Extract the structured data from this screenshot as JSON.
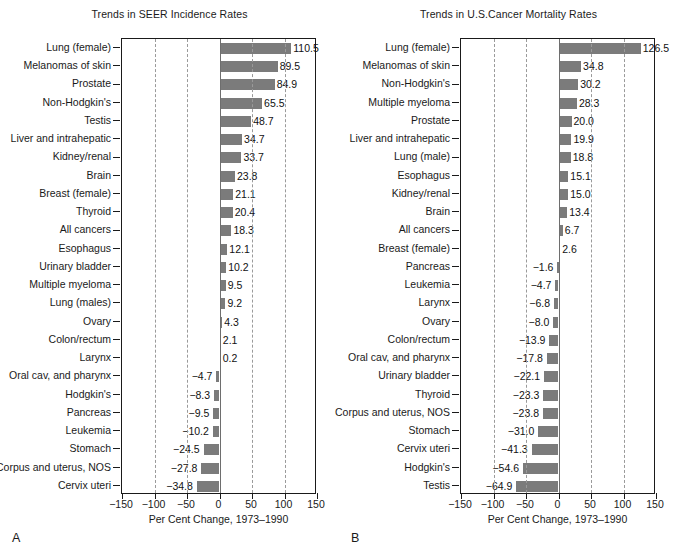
{
  "figure": {
    "axis_title": "Per Cent Change, 1973–1990",
    "bar_color": "#7b7b7b",
    "grid_color": "#9a9a9a",
    "axis_color": "#1a1a1a"
  },
  "panels": [
    {
      "letter": "A",
      "title": "Trends in SEER Incidence Rates",
      "axis_title": "Per Cent Change, 1973–1990"
    },
    {
      "letter": "B",
      "title": "Trends in U.S.Cancer Mortality Rates",
      "axis_title": "Per Cent Change, 1973–1990"
    }
  ],
  "chart_data": [
    {
      "type": "bar",
      "orientation": "horizontal",
      "panel": "A",
      "title": "Trends in SEER Incidence Rates",
      "xlabel": "Per Cent Change, 1973–1990",
      "ylabel": "",
      "xlim": [
        -150,
        150
      ],
      "xticks": [
        -150,
        -100,
        -50,
        0,
        50,
        100,
        150
      ],
      "xtick_labels": [
        "−150",
        "−100",
        "−50",
        "0",
        "50",
        "100",
        "150"
      ],
      "grid": "vertical-dashed",
      "legend": "none",
      "categories": [
        "Lung (female)",
        "Melanomas of skin",
        "Prostate",
        "Non-Hodgkin's",
        "Testis",
        "Liver and intrahepatic",
        "Kidney/renal",
        "Brain",
        "Breast (female)",
        "Thyroid",
        "All cancers",
        "Esophagus",
        "Urinary bladder",
        "Multiple myeloma",
        "Lung (males)",
        "Ovary",
        "Colon/rectum",
        "Larynx",
        "Oral cav, and pharynx",
        "Hodgkin's",
        "Pancreas",
        "Leukemia",
        "Stomach",
        "Corpus and uterus, NOS",
        "Cervix uteri"
      ],
      "values": [
        110.5,
        89.5,
        84.9,
        65.5,
        48.7,
        34.7,
        33.7,
        23.8,
        21.1,
        20.4,
        18.3,
        12.1,
        10.2,
        9.5,
        9.2,
        4.3,
        2.1,
        0.2,
        -4.7,
        -8.3,
        -9.5,
        -10.2,
        -24.5,
        -27.8,
        -34.8
      ],
      "value_labels": [
        "110.5",
        "89.5",
        "84.9",
        "65.5",
        "48.7",
        "34.7",
        "33.7",
        "23.8",
        "21.1",
        "20.4",
        "18.3",
        "12.1",
        "10.2",
        "9.5",
        "9.2",
        "4.3",
        "2.1",
        "0.2",
        "−4.7",
        "−8.3",
        "−9.5",
        "−10.2",
        "−24.5",
        "−27.8",
        "−34.8"
      ]
    },
    {
      "type": "bar",
      "orientation": "horizontal",
      "panel": "B",
      "title": "Trends in U.S.Cancer Mortality Rates",
      "xlabel": "Per Cent Change, 1973–1990",
      "ylabel": "",
      "xlim": [
        -150,
        150
      ],
      "xticks": [
        -150,
        -100,
        -50,
        0,
        50,
        100,
        150
      ],
      "xtick_labels": [
        "−150",
        "−100",
        "−50",
        "0",
        "50",
        "100",
        "150"
      ],
      "grid": "vertical-dashed",
      "legend": "none",
      "categories": [
        "Lung (female)",
        "Melanomas of skin",
        "Non-Hodgkin's",
        "Multiple myeloma",
        "Prostate",
        "Liver and intrahepatic",
        "Lung (male)",
        "Esophagus",
        "Kidney/renal",
        "Brain",
        "All cancers",
        "Breast (female)",
        "Pancreas",
        "Leukemia",
        "Larynx",
        "Ovary",
        "Colon/rectum",
        "Oral cav, and pharynx",
        "Urinary bladder",
        "Thyroid",
        "Corpus and uterus, NOS",
        "Stomach",
        "Cervix uteri",
        "Hodgkin's",
        "Testis"
      ],
      "values": [
        126.5,
        34.8,
        30.2,
        28.3,
        20.0,
        19.9,
        18.8,
        15.1,
        15.0,
        13.4,
        6.7,
        2.6,
        -1.6,
        -4.7,
        -6.8,
        -8.0,
        -13.9,
        -17.8,
        -22.1,
        -23.3,
        -23.8,
        -31.0,
        -41.3,
        -54.6,
        -64.9
      ],
      "value_labels": [
        "126.5",
        "34.8",
        "30.2",
        "28.3",
        "20.0",
        "19.9",
        "18.8",
        "15.1",
        "15.0",
        "13.4",
        "6.7",
        "2.6",
        "−1.6",
        "−4.7",
        "−6.8",
        "−8.0",
        "−13.9",
        "−17.8",
        "−22.1",
        "−23.3",
        "−23.8",
        "−31.0",
        "−41.3",
        "−54.6",
        "−64.9"
      ]
    }
  ]
}
